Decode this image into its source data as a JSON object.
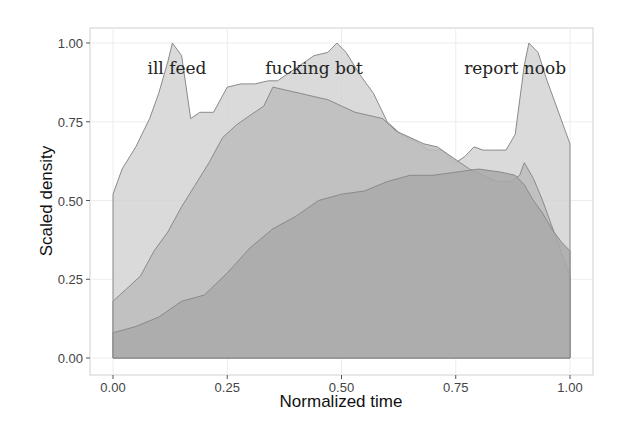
{
  "chart_data": {
    "type": "area",
    "title": "",
    "xlabel": "Normalized time",
    "ylabel": "Scaled density",
    "xlim": [
      -0.05,
      1.05
    ],
    "ylim": [
      -0.05,
      1.05
    ],
    "x_ticks": [
      "0.00",
      "0.25",
      "0.50",
      "0.75",
      "1.00"
    ],
    "y_ticks": [
      "0.00",
      "0.25",
      "0.50",
      "0.75",
      "1.00"
    ],
    "grid": true,
    "legend": "none",
    "annotations": [
      {
        "text": "ill feed",
        "x": 0.14,
        "y": 0.92
      },
      {
        "text": "fucking bot",
        "x": 0.44,
        "y": 0.92
      },
      {
        "text": "report noob",
        "x": 0.88,
        "y": 0.92
      }
    ],
    "series": [
      {
        "name": "ill feed",
        "color": "#d4d4d4",
        "x": [
          0.0,
          0.02,
          0.05,
          0.08,
          0.1,
          0.12,
          0.13,
          0.15,
          0.17,
          0.19,
          0.22,
          0.25,
          0.28,
          0.31,
          0.34,
          0.36,
          0.4,
          0.44,
          0.47,
          0.49,
          0.51,
          0.54,
          0.57,
          0.6,
          0.63,
          0.66,
          0.69,
          0.72,
          0.75,
          0.77,
          0.79,
          0.81,
          0.83,
          0.86,
          0.88,
          0.9,
          0.91,
          0.93,
          0.95,
          0.97,
          0.99,
          1.0
        ],
        "y": [
          0.52,
          0.6,
          0.67,
          0.76,
          0.84,
          0.94,
          1.0,
          0.96,
          0.76,
          0.78,
          0.78,
          0.86,
          0.87,
          0.87,
          0.88,
          0.88,
          0.92,
          0.96,
          0.97,
          1.0,
          0.97,
          0.9,
          0.84,
          0.75,
          0.71,
          0.69,
          0.66,
          0.66,
          0.62,
          0.64,
          0.67,
          0.66,
          0.66,
          0.66,
          0.71,
          0.93,
          1.0,
          0.97,
          0.88,
          0.8,
          0.72,
          0.68
        ]
      },
      {
        "name": "fucking bot",
        "color": "#bcbcbc",
        "x": [
          0.0,
          0.03,
          0.06,
          0.09,
          0.12,
          0.15,
          0.18,
          0.21,
          0.24,
          0.27,
          0.3,
          0.33,
          0.35,
          0.38,
          0.41,
          0.44,
          0.47,
          0.5,
          0.53,
          0.56,
          0.59,
          0.62,
          0.65,
          0.68,
          0.71,
          0.73,
          0.76,
          0.78,
          0.81,
          0.84,
          0.87,
          0.89,
          0.9,
          0.92,
          0.94,
          0.96,
          0.98,
          1.0
        ],
        "y": [
          0.18,
          0.22,
          0.26,
          0.34,
          0.4,
          0.48,
          0.55,
          0.62,
          0.7,
          0.74,
          0.77,
          0.8,
          0.86,
          0.85,
          0.84,
          0.83,
          0.82,
          0.8,
          0.78,
          0.77,
          0.76,
          0.72,
          0.7,
          0.68,
          0.67,
          0.65,
          0.62,
          0.6,
          0.58,
          0.56,
          0.56,
          0.58,
          0.62,
          0.57,
          0.5,
          0.42,
          0.34,
          0.26
        ]
      },
      {
        "name": "report noob",
        "color": "#a9a9a9",
        "x": [
          0.0,
          0.05,
          0.1,
          0.15,
          0.2,
          0.25,
          0.3,
          0.35,
          0.4,
          0.45,
          0.5,
          0.55,
          0.6,
          0.65,
          0.7,
          0.75,
          0.8,
          0.85,
          0.88,
          0.9,
          0.92,
          0.94,
          0.96,
          0.98,
          1.0
        ],
        "y": [
          0.08,
          0.1,
          0.13,
          0.18,
          0.2,
          0.27,
          0.35,
          0.41,
          0.45,
          0.5,
          0.52,
          0.53,
          0.56,
          0.58,
          0.58,
          0.59,
          0.6,
          0.59,
          0.58,
          0.55,
          0.5,
          0.46,
          0.41,
          0.37,
          0.34
        ]
      }
    ]
  },
  "axis": {
    "x_title": "Normalized time",
    "y_title": "Scaled density"
  }
}
